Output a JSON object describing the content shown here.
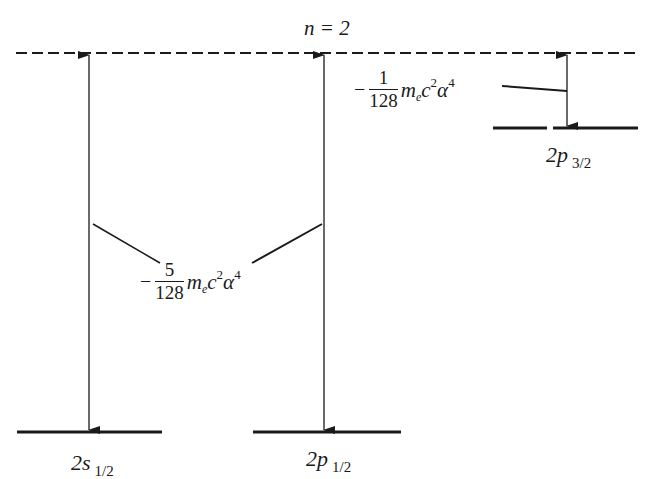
{
  "diagram": {
    "title": "n = 2",
    "reference_level": "n = 2 (unperturbed, dashed)",
    "levels": [
      {
        "id": "2s_1/2",
        "main": "2s",
        "sub": "1/2"
      },
      {
        "id": "2p_1/2",
        "main": "2p",
        "sub": "1/2"
      },
      {
        "id": "2p_3/2",
        "main": "2p",
        "sub": "3/2"
      }
    ],
    "shifts": [
      {
        "applies_to": [
          "2s_1/2",
          "2p_1/2"
        ],
        "sign": "−",
        "numerator": "5",
        "denominator": "128",
        "factor_m": "m",
        "factor_m_sub": "e",
        "factor_c": "c",
        "factor_c_sup": "2",
        "factor_alpha": "α",
        "factor_alpha_sup": "4"
      },
      {
        "applies_to": [
          "2p_3/2"
        ],
        "sign": "−",
        "numerator": "1",
        "denominator": "128",
        "factor_m": "m",
        "factor_m_sub": "e",
        "factor_c": "c",
        "factor_c_sup": "2",
        "factor_alpha": "α",
        "factor_alpha_sup": "4"
      }
    ],
    "colors": {
      "ink": "#1a1a1a",
      "background": "#ffffff"
    }
  }
}
